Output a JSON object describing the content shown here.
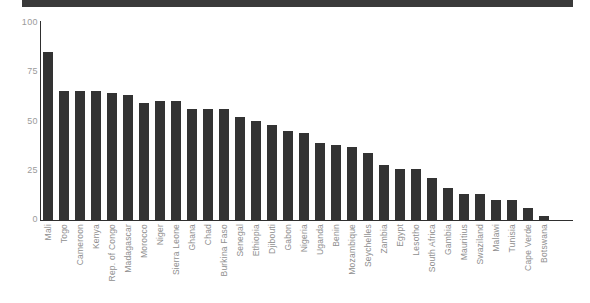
{
  "header": {
    "banner_color": "#3a3a3a"
  },
  "chart_data": {
    "type": "bar",
    "title": "",
    "subtitle": "",
    "xlabel": "",
    "ylabel": "",
    "ylim": [
      0,
      100
    ],
    "yticks": [
      0,
      25,
      50,
      75,
      100
    ],
    "ytick_labels": [
      "0",
      "25",
      "50",
      "75",
      "100"
    ],
    "grid": false,
    "legend": "none",
    "bar_color": "#333333",
    "axis_color": "#2f2f2f",
    "tick_label_color": "#9b9b9b",
    "categories": [
      "Mali",
      "Togo",
      "Cameroon",
      "Kenya",
      "Rep. of Congo",
      "Madagascar",
      "Morocco",
      "Niger",
      "Sierra Leone",
      "Ghana",
      "Chad",
      "Burkina Faso",
      "Senegal",
      "Ethiopia",
      "Djibouti",
      "Gabon",
      "Nigeria",
      "Uganda",
      "Benin",
      "Mozambique",
      "Seychelles",
      "Zambia",
      "Egypt",
      "Lesotho",
      "South Africa",
      "Gambia",
      "Mauritius",
      "Swaziland",
      "Malawi",
      "Tunisia",
      "Cape Verde",
      "Botswana"
    ],
    "values": [
      85,
      65,
      65,
      65,
      64,
      63,
      59,
      60,
      60,
      56,
      56,
      56,
      52,
      50,
      48,
      45,
      44,
      39,
      38,
      37,
      34,
      28,
      26,
      26,
      21,
      16,
      13,
      13,
      10,
      10,
      6,
      2
    ]
  }
}
